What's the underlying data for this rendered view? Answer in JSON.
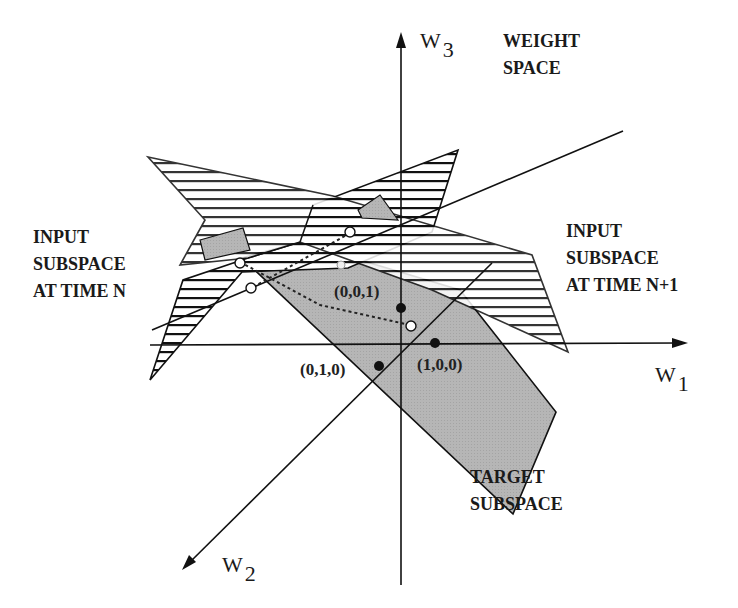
{
  "diagram": {
    "axes": {
      "w1": {
        "base": "W",
        "sub": "1"
      },
      "w2": {
        "base": "W",
        "sub": "2"
      },
      "w3": {
        "base": "W",
        "sub": "3"
      }
    },
    "labels": {
      "weight_space": [
        "WEIGHT",
        "SPACE"
      ],
      "input_n": [
        "INPUT",
        "SUBSPACE",
        "AT TIME N"
      ],
      "input_n1": [
        "INPUT",
        "SUBSPACE",
        "AT TIME N+1"
      ],
      "target": [
        "TARGET",
        "SUBSPACE"
      ]
    },
    "points": {
      "p001": "(0,0,1)",
      "p100": "(1,0,0)",
      "p010": "(0,1,0)"
    },
    "colors": {
      "target_fill": "#b4b4b4",
      "line": "#111111"
    }
  }
}
